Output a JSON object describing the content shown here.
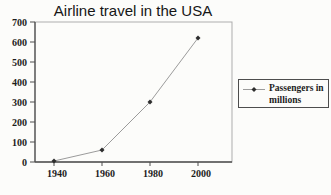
{
  "window": {
    "width": 331,
    "height": 195
  },
  "colors": {
    "background": "#fcfcfa",
    "line": "#9b9b9b",
    "marker": "#2d2d2d",
    "axis": "#4f4f4f",
    "plot_border": "#adadad",
    "text": "#1c1c1c",
    "legend_border": "#4d4d4d"
  },
  "chart_data": {
    "type": "line",
    "title": "Airline travel in the USA",
    "x": [
      1940,
      1960,
      1980,
      2000
    ],
    "x_ticks": [
      1940,
      1960,
      1980,
      2000
    ],
    "y_ticks": [
      0,
      100,
      200,
      300,
      400,
      500,
      600,
      700
    ],
    "ylim": [
      0,
      700
    ],
    "xlabel": "",
    "ylabel": "",
    "grid": false,
    "legend_position": "right",
    "marker_shape": "diamond",
    "series": [
      {
        "name": "Passengers in millions",
        "values": [
          5,
          60,
          300,
          620
        ]
      }
    ]
  }
}
